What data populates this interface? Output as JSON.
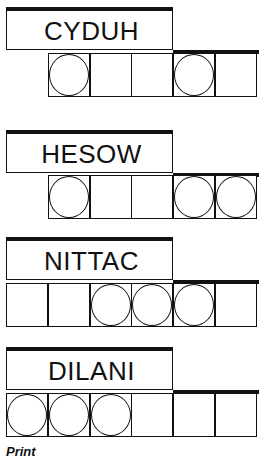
{
  "puzzles": [
    {
      "word": "CYDUH",
      "cells_left": 48,
      "cells": [
        true,
        false,
        false,
        true,
        false
      ],
      "top": 7
    },
    {
      "word": "HESOW",
      "cells_left": 48,
      "cells": [
        true,
        false,
        false,
        true,
        true
      ],
      "top": 130
    },
    {
      "word": "NITTAC",
      "cells_left": 6,
      "cells": [
        false,
        false,
        true,
        true,
        true,
        false
      ],
      "top": 237
    },
    {
      "word": "DILANI",
      "cells_left": 6,
      "cells": [
        true,
        true,
        true,
        false,
        false,
        false
      ],
      "top": 347
    }
  ],
  "footer": {
    "label": "Print"
  },
  "colors": {
    "ink": "#111111",
    "background": "#ffffff"
  }
}
